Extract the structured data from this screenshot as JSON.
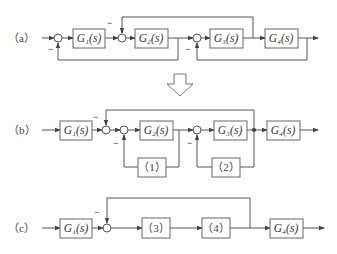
{
  "diagram": {
    "panel_a": {
      "label": "（a）",
      "blocks": [
        "G₁(s)",
        "G₂(s)",
        "G₃(s)",
        "G₄(s)"
      ],
      "signs": [
        "−",
        "−",
        "−"
      ]
    },
    "transform_arrow": "down-arrow",
    "panel_b": {
      "label": "（b）",
      "blocks": [
        "G₁(s)",
        "G₂(s)",
        "G₃(s)",
        "G₄(s)",
        "（1）",
        "（2）"
      ],
      "signs": [
        "−",
        "−",
        "−"
      ]
    },
    "panel_c": {
      "label": "（c）",
      "blocks": [
        "G₁(s)",
        "（3）",
        "（4）",
        "G₄(s)"
      ],
      "signs": [
        "−"
      ]
    }
  }
}
